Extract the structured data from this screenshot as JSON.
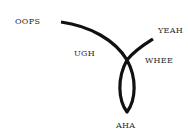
{
  "diagram": {
    "type": "curve-with-loop",
    "stroke_color": "#111111",
    "labels": {
      "start": "OOPS",
      "middle_left": "UGH",
      "end": "YEAH",
      "middle_right": "WHEE",
      "loop_bottom": "AHA"
    }
  }
}
